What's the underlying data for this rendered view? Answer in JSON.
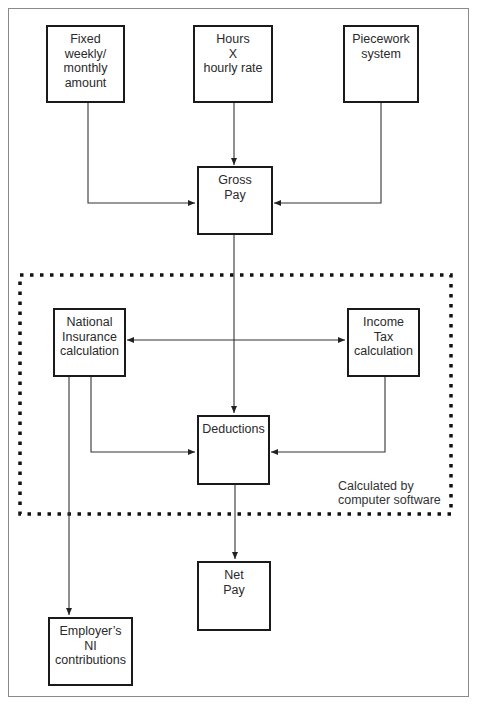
{
  "diagram": {
    "title": "",
    "nodes": {
      "fixed": {
        "lines": [
          "Fixed",
          "weekly/",
          "monthly",
          "amount"
        ]
      },
      "hours": {
        "lines": [
          "Hours",
          "X",
          "hourly rate"
        ]
      },
      "piecework": {
        "lines": [
          "Piecework",
          "system"
        ]
      },
      "gross": {
        "lines": [
          "Gross",
          "Pay"
        ]
      },
      "ni": {
        "lines": [
          "National",
          "Insurance",
          "calculation"
        ]
      },
      "tax": {
        "lines": [
          "Income",
          "Tax",
          "calculation"
        ]
      },
      "deductions": {
        "lines": [
          "Deductions"
        ]
      },
      "net": {
        "lines": [
          "Net",
          "Pay"
        ]
      },
      "employer_ni": {
        "lines": [
          "Employer’s",
          "NI",
          "contributions"
        ]
      }
    },
    "group": {
      "label_lines": [
        "Calculated by",
        "computer software"
      ],
      "style": "dotted"
    },
    "edges": [
      {
        "from": "fixed",
        "to": "gross"
      },
      {
        "from": "hours",
        "to": "gross"
      },
      {
        "from": "piecework",
        "to": "gross"
      },
      {
        "from": "gross",
        "to": "deductions"
      },
      {
        "from": "ni",
        "to": "tax",
        "bidirectional": true
      },
      {
        "from": "ni",
        "to": "deductions"
      },
      {
        "from": "tax",
        "to": "deductions"
      },
      {
        "from": "ni",
        "to": "employer_ni"
      },
      {
        "from": "deductions",
        "to": "net"
      }
    ],
    "colors": {
      "box_border": "#1a1a1a",
      "line": "#333333",
      "frame": "#8a8a8a",
      "dots": "#111111"
    }
  }
}
